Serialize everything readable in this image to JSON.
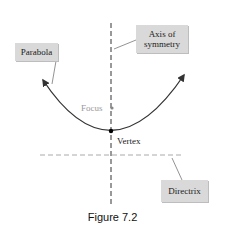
{
  "diagram": {
    "labels": {
      "parabola": "Parabola",
      "axis_line1": "Axis of",
      "axis_line2": "symmetry",
      "focus": "Focus",
      "vertex": "Vertex",
      "directrix": "Directrix"
    },
    "caption": "Figure 7.2",
    "colors": {
      "curve": "#333333",
      "axis": "#333333",
      "directrix": "#aaaaaa",
      "focus_text": "#999999",
      "callout_bg": "#d9d9d9",
      "text": "#1a1a1a"
    },
    "geometry": {
      "vertex": [
        111,
        131
      ],
      "focus": [
        112,
        108
      ],
      "axis_x": 111,
      "directrix_y": 155
    }
  }
}
